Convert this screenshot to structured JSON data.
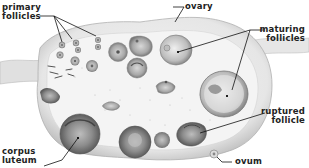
{
  "diagram": {
    "labels": {
      "primary_follicles_1": "primary",
      "primary_follicles_2": "follicles",
      "ovary": "ovary",
      "maturing_follicles_1": "maturing",
      "maturing_follicles_2": "follicles",
      "ruptured_follicle_1": "ruptured",
      "ruptured_follicle_2": "follicle",
      "corpus_luteum_1": "corpus",
      "corpus_luteum_2": "luteum",
      "ovum": "ovum"
    },
    "colors": {
      "background": "#ffffff",
      "ovary_fill": "#e4e4e4",
      "ovary_edge": "#b8b8b8",
      "stroma": "#f2f2f2",
      "follicle_dark": "#8a8a8a",
      "text": "#222222"
    }
  }
}
